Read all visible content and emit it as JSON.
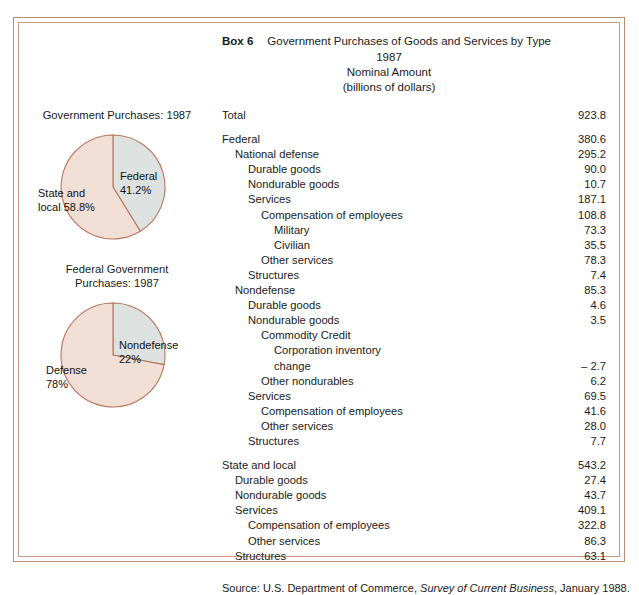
{
  "frame": {
    "border_color": "#b98b73"
  },
  "header": {
    "box_label": "Box 6",
    "title": "Government Purchases of Goods and Services by Type",
    "year": "1987",
    "measure": "Nominal Amount",
    "units": "(billions of dollars)"
  },
  "table": {
    "rows": [
      {
        "indent": 0,
        "label": "Total",
        "value": "923.8"
      },
      {
        "spacer": true
      },
      {
        "indent": 0,
        "label": "Federal",
        "value": "380.6"
      },
      {
        "indent": 1,
        "label": "National defense",
        "value": "295.2"
      },
      {
        "indent": 2,
        "label": "Durable goods",
        "value": "90.0"
      },
      {
        "indent": 2,
        "label": "Nondurable goods",
        "value": "10.7"
      },
      {
        "indent": 2,
        "label": "Services",
        "value": "187.1"
      },
      {
        "indent": 3,
        "label": "Compensation of employees",
        "value": "108.8"
      },
      {
        "indent": 4,
        "label": "Military",
        "value": "73.3"
      },
      {
        "indent": 4,
        "label": "Civilian",
        "value": "35.5"
      },
      {
        "indent": 3,
        "label": "Other services",
        "value": "78.3"
      },
      {
        "indent": 2,
        "label": "Structures",
        "value": "7.4"
      },
      {
        "indent": 1,
        "label": "Nondefense",
        "value": "85.3"
      },
      {
        "indent": 2,
        "label": "Durable goods",
        "value": "4.6"
      },
      {
        "indent": 2,
        "label": "Nondurable goods",
        "value": "3.5"
      },
      {
        "indent": 3,
        "label": "Commodity Credit",
        "value": ""
      },
      {
        "indent": 4,
        "label": "Corporation inventory",
        "value": ""
      },
      {
        "indent": 4,
        "label": "change",
        "value": "– 2.7"
      },
      {
        "indent": 3,
        "label": "Other nondurables",
        "value": "6.2"
      },
      {
        "indent": 2,
        "label": "Services",
        "value": "69.5"
      },
      {
        "indent": 3,
        "label": "Compensation of employees",
        "value": "41.6"
      },
      {
        "indent": 3,
        "label": "Other services",
        "value": "28.0"
      },
      {
        "indent": 2,
        "label": "Structures",
        "value": "7.7"
      },
      {
        "spacer": true
      },
      {
        "indent": 0,
        "label": "State and local",
        "value": "543.2"
      },
      {
        "indent": 1,
        "label": "Durable goods",
        "value": "27.4"
      },
      {
        "indent": 1,
        "label": "Nondurable goods",
        "value": "43.7"
      },
      {
        "indent": 1,
        "label": "Services",
        "value": "409.1"
      },
      {
        "indent": 2,
        "label": "Compensation of employees",
        "value": "322.8"
      },
      {
        "indent": 2,
        "label": "Other services",
        "value": "86.3"
      },
      {
        "indent": 1,
        "label": "Structures",
        "value": "63.1"
      }
    ]
  },
  "source": {
    "prefix": "Source:  U.S. Department of Commerce, ",
    "italic": "Survey of Current Business",
    "suffix": ", January 1988."
  },
  "chart_data": [
    {
      "type": "pie",
      "title": "Government Purchases:  1987",
      "categories": [
        "Federal",
        "State and local"
      ],
      "values": [
        41.2,
        58.8
      ],
      "labels": [
        "Federal\n41.2%",
        "State and\nlocal 58.8%"
      ],
      "colors": [
        "#dde1e0",
        "#f1ded5"
      ],
      "stroke": "#b5765e",
      "legend": "inside-slices"
    },
    {
      "type": "pie",
      "title": "Federal Government\nPurchases: 1987",
      "categories": [
        "Nondefense",
        "Defense"
      ],
      "values": [
        22,
        78
      ],
      "labels": [
        "Nondefense\n22%",
        "Defense\n78%"
      ],
      "colors": [
        "#dde1e0",
        "#f1ded5"
      ],
      "stroke": "#b5765e",
      "legend": "inside-slices"
    }
  ]
}
